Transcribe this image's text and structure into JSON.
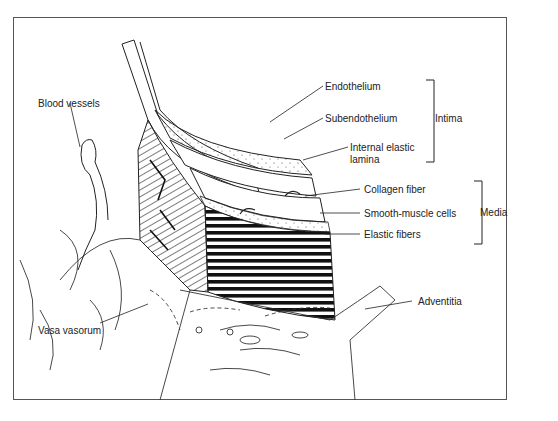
{
  "diagram": {
    "labels": {
      "endothelium": "Endothelium",
      "subendothelium": "Subendothelium",
      "internal_elastic_lamina_1": "Internal elastic",
      "internal_elastic_lamina_2": "lamina",
      "collagen_fiber": "Collagen fiber",
      "smooth_muscle_cells": "Smooth-muscle cells",
      "elastic_fibers": "Elastic fibers",
      "adventitia": "Adventitia",
      "blood_vessels": "Blood vessels",
      "vasa_vasorum": "Vasa vasorum"
    },
    "groups": {
      "intima": "Intima",
      "media": "Media"
    },
    "colors": {
      "ink": "#222222",
      "frame": "#555555",
      "background": "#ffffff"
    }
  }
}
